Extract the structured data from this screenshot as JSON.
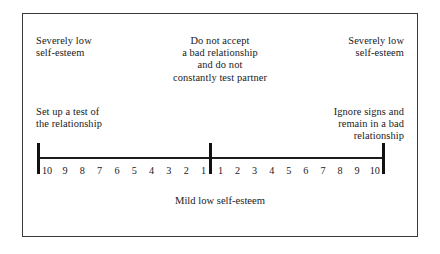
{
  "figure": {
    "frame_color": "#39393b",
    "axis_color": "#1c1c1c",
    "text_color": "#1a1a1a"
  },
  "annotations": {
    "left_top": "Severely low\nself-esteem",
    "center_top": "Do not accept\na bad relationship\nand do not\nconstantly test partner",
    "right_top": "Severely low\nself-esteem",
    "left_mid": "Set up a test of\nthe relationship",
    "right_mid": "Ignore signs and\nremain in a bad\nrelationship"
  },
  "caption": "Mild low self-esteem",
  "chart_data": {
    "type": "bar",
    "subtitle": "",
    "xlabel": "Mild low self-esteem",
    "ylabel": "",
    "grid": false,
    "legend_position": "none",
    "axis_style": "bipolar number line with three end/center ticks",
    "left_scale_labels": [
      "10",
      "9",
      "8",
      "7",
      "6",
      "5",
      "4",
      "3",
      "2",
      "1"
    ],
    "right_scale_labels": [
      "1",
      "2",
      "3",
      "4",
      "5",
      "6",
      "7",
      "8",
      "9",
      "10"
    ],
    "categories": [
      "10",
      "9",
      "8",
      "7",
      "6",
      "5",
      "4",
      "3",
      "2",
      "1",
      "1",
      "2",
      "3",
      "4",
      "5",
      "6",
      "7",
      "8",
      "9",
      "10"
    ],
    "values": [
      10,
      9,
      8,
      7,
      6,
      5,
      4,
      3,
      2,
      1,
      1,
      2,
      3,
      4,
      5,
      6,
      7,
      8,
      9,
      10
    ],
    "xlim": [
      -10,
      10
    ],
    "center_value": 0,
    "annotations": [
      {
        "position": "left-end-above",
        "text": "Severely low self-esteem"
      },
      {
        "position": "center-above",
        "text": "Do not accept a bad relationship and do not constantly test partner"
      },
      {
        "position": "right-end-above",
        "text": "Severely low self-esteem"
      },
      {
        "position": "left-end-mid",
        "text": "Set up a test of the relationship"
      },
      {
        "position": "right-end-mid",
        "text": "Ignore signs and remain in a bad relationship"
      },
      {
        "position": "center-below",
        "text": "Mild low self-esteem"
      }
    ]
  }
}
